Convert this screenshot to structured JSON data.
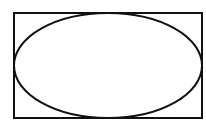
{
  "diagram": {
    "shapes": [
      {
        "type": "rectangle",
        "x": 14,
        "y": 13,
        "width": 188,
        "height": 105,
        "stroke": "#111111",
        "stroke_width": 2
      },
      {
        "type": "ellipse",
        "cx": 108,
        "cy": 65.5,
        "rx": 94,
        "ry": 52.5,
        "stroke": "#111111",
        "stroke_width": 2
      }
    ],
    "background": "#ffffff"
  }
}
